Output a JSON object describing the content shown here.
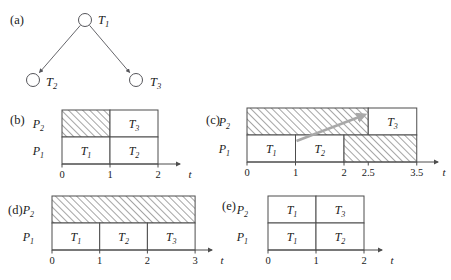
{
  "figure": {
    "panels": {
      "a": "(a)",
      "b": "(b)",
      "c": "(c)",
      "d": "(d)",
      "e": "(e)"
    },
    "axis_label": "t",
    "processor_labels": {
      "p1_base": "P",
      "p1_sub": "1",
      "p2_base": "P",
      "p2_sub": "2"
    },
    "task_base": "T",
    "task_subs": {
      "t1": "1",
      "t2": "2",
      "t3": "3"
    }
  },
  "task_graph": {
    "nodes": [
      {
        "id": "T1",
        "label_base": "T",
        "label_sub": "1",
        "cx": 85,
        "cy": 20,
        "r": 6.5,
        "text_x": 98,
        "text_y": 20
      },
      {
        "id": "T2",
        "label_base": "T",
        "label_sub": "2",
        "cx": 33,
        "cy": 80,
        "r": 6.5,
        "text_x": 46,
        "text_y": 82
      },
      {
        "id": "T3",
        "label_base": "T",
        "label_sub": "3",
        "cx": 136,
        "cy": 80,
        "r": 6.5,
        "text_x": 150,
        "text_y": 82
      }
    ],
    "edges": [
      {
        "from": "T1",
        "to": "T2"
      },
      {
        "from": "T1",
        "to": "T3"
      }
    ]
  },
  "chart_data": [
    {
      "id": "b",
      "type": "gantt",
      "panel": "(b)",
      "xlabel": "t",
      "xlim": [
        0,
        2
      ],
      "ticks": [
        "0",
        "1",
        "2"
      ],
      "tick_values": [
        0,
        1,
        2
      ],
      "rows": [
        {
          "processor": "P2",
          "blocks": [
            {
              "label": "",
              "sub": "",
              "start": 0,
              "end": 1,
              "hatched": true
            },
            {
              "label": "T",
              "sub": "3",
              "start": 1,
              "end": 2,
              "hatched": false
            }
          ]
        },
        {
          "processor": "P1",
          "blocks": [
            {
              "label": "T",
              "sub": "1",
              "start": 0,
              "end": 1,
              "hatched": false
            },
            {
              "label": "T",
              "sub": "2",
              "start": 1,
              "end": 2,
              "hatched": false
            }
          ]
        }
      ]
    },
    {
      "id": "c",
      "type": "gantt",
      "panel": "(c)",
      "xlabel": "t",
      "xlim": [
        0,
        3.5
      ],
      "ticks": [
        "0",
        "1",
        "2",
        "2.5",
        "3.5"
      ],
      "tick_values": [
        0,
        1,
        2,
        2.5,
        3.5
      ],
      "migration_arrow": {
        "from_x": 1,
        "from_row": "P1",
        "to_x": 2.5,
        "to_row": "P2"
      },
      "rows": [
        {
          "processor": "P2",
          "blocks": [
            {
              "label": "",
              "sub": "",
              "start": 0,
              "end": 2.5,
              "hatched": true
            },
            {
              "label": "T",
              "sub": "3",
              "start": 2.5,
              "end": 3.5,
              "hatched": false
            }
          ]
        },
        {
          "processor": "P1",
          "blocks": [
            {
              "label": "T",
              "sub": "1",
              "start": 0,
              "end": 1,
              "hatched": false
            },
            {
              "label": "T",
              "sub": "2",
              "start": 1,
              "end": 2,
              "hatched": false
            },
            {
              "label": "",
              "sub": "",
              "start": 2,
              "end": 3.5,
              "hatched": true
            }
          ]
        }
      ]
    },
    {
      "id": "d",
      "type": "gantt",
      "panel": "(d)",
      "xlabel": "t",
      "xlim": [
        0,
        3
      ],
      "ticks": [
        "0",
        "1",
        "2",
        "3"
      ],
      "tick_values": [
        0,
        1,
        2,
        3
      ],
      "rows": [
        {
          "processor": "P2",
          "blocks": [
            {
              "label": "",
              "sub": "",
              "start": 0,
              "end": 3,
              "hatched": true
            }
          ]
        },
        {
          "processor": "P1",
          "blocks": [
            {
              "label": "T",
              "sub": "1",
              "start": 0,
              "end": 1,
              "hatched": false
            },
            {
              "label": "T",
              "sub": "2",
              "start": 1,
              "end": 2,
              "hatched": false
            },
            {
              "label": "T",
              "sub": "3",
              "start": 2,
              "end": 3,
              "hatched": false
            }
          ]
        }
      ]
    },
    {
      "id": "e",
      "type": "gantt",
      "panel": "(e)",
      "xlabel": "t",
      "xlim": [
        0,
        2
      ],
      "ticks": [
        "0",
        "1",
        "2"
      ],
      "tick_values": [
        0,
        1,
        2
      ],
      "rows": [
        {
          "processor": "P2",
          "blocks": [
            {
              "label": "T",
              "sub": "1",
              "start": 0,
              "end": 1,
              "hatched": false
            },
            {
              "label": "T",
              "sub": "3",
              "start": 1,
              "end": 2,
              "hatched": false
            }
          ]
        },
        {
          "processor": "P1",
          "blocks": [
            {
              "label": "T",
              "sub": "1",
              "start": 0,
              "end": 1,
              "hatched": false
            },
            {
              "label": "T",
              "sub": "2",
              "start": 1,
              "end": 2,
              "hatched": false
            }
          ]
        }
      ]
    }
  ],
  "colors": {
    "background": "#ffffff",
    "stroke": "#4d4d4d",
    "hatch": "#9a9a9a",
    "arrow": "#a8a8a8",
    "text": "#1a1a1a"
  },
  "geometry": {
    "panels": [
      {
        "id": "b",
        "label_x": 10,
        "label_y": 124,
        "proc_x": 44,
        "x0": 62,
        "unit": 48,
        "row_top": 110,
        "row_h": 27,
        "axis_y": 164,
        "axis_end": 180,
        "axis_label_x": 190
      },
      {
        "id": "c",
        "label_x": 206,
        "label_y": 124,
        "proc_x": 230,
        "x0": 247,
        "unit": 48.5,
        "row_top": 108,
        "row_h": 27,
        "axis_y": 162,
        "axis_end": 438,
        "axis_label_x": 444
      },
      {
        "id": "d",
        "label_x": 8,
        "label_y": 214,
        "proc_x": 34,
        "x0": 52,
        "unit": 47.7,
        "row_top": 196,
        "row_h": 27,
        "axis_y": 250,
        "axis_end": 212,
        "axis_label_x": 222
      },
      {
        "id": "e",
        "label_x": 222,
        "label_y": 210,
        "proc_x": 248,
        "x0": 268,
        "unit": 48,
        "row_top": 196,
        "row_h": 27,
        "axis_y": 250,
        "axis_end": 382,
        "axis_label_x": 392
      }
    ]
  }
}
